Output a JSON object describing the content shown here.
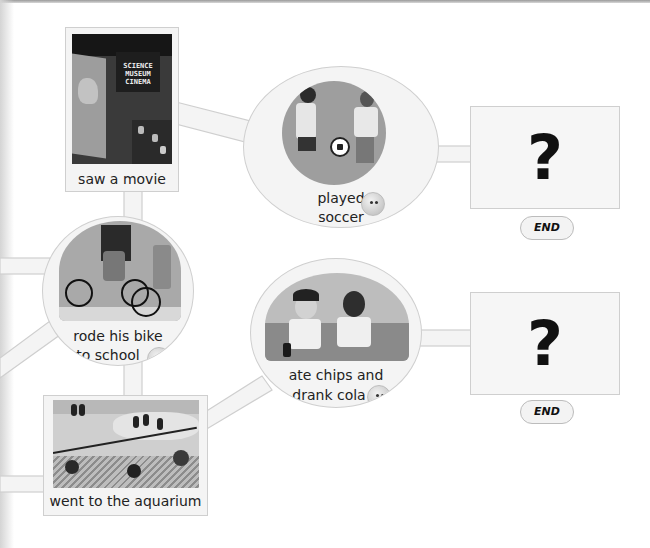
{
  "diagram": {
    "type": "story-path-flowchart",
    "nodes": [
      {
        "id": "saw_movie",
        "shape": "card",
        "label": "saw a movie",
        "image": "Science Museum Cinema theater with dinosaur on screen",
        "image_text": [
          "SCIENCE",
          "MUSEUM",
          "CINEMA"
        ]
      },
      {
        "id": "played_soccer",
        "shape": "circle",
        "label_line1": "played",
        "label_line2": "soccer",
        "image": "two kids playing soccer",
        "has_smiley": true
      },
      {
        "id": "rode_bike",
        "shape": "circle",
        "label_line1": "rode his bike",
        "label_line2": "to school",
        "image": "kids riding bicycles",
        "has_smiley": true
      },
      {
        "id": "ate_chips",
        "shape": "circle",
        "label_line1": "ate chips and",
        "label_line2": "drank cola",
        "image": "two boys eating chips and drinking cola",
        "has_smiley": true
      },
      {
        "id": "aquarium",
        "shape": "card",
        "label": "went to the aquarium",
        "image": "penguin exhibit with crowd watching"
      },
      {
        "id": "end_top",
        "shape": "question-box",
        "symbol": "?",
        "end_label": "END"
      },
      {
        "id": "end_bottom",
        "shape": "question-box",
        "symbol": "?",
        "end_label": "END"
      }
    ],
    "edges": [
      {
        "from": "saw_movie",
        "to": "played_soccer"
      },
      {
        "from": "played_soccer",
        "to": "end_top"
      },
      {
        "from": "saw_movie",
        "to": "rode_bike"
      },
      {
        "from": "rode_bike",
        "to": "aquarium"
      },
      {
        "from": "aquarium",
        "to": "ate_chips"
      },
      {
        "from": "ate_chips",
        "to": "end_bottom"
      }
    ]
  },
  "icons": {
    "smiley": "smiley-face-icon",
    "question": "question-mark-icon"
  },
  "colors": {
    "background": "#ffffff",
    "node_fill": "#f4f4f4",
    "node_border": "#cfcfcf",
    "text": "#222222"
  }
}
